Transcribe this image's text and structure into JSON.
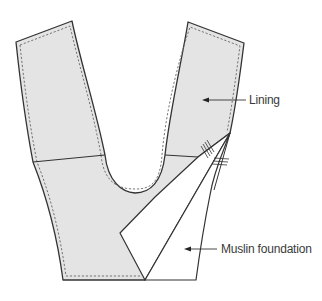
{
  "diagram": {
    "type": "garment pattern illustration",
    "colors": {
      "lining_fill": "#e4e4e4",
      "muslin_fill": "#ffffff",
      "outline": "#333333",
      "stitch": "#666666",
      "text": "#3a3a3a",
      "background": "#ffffff"
    },
    "labels": {
      "lining": "Lining",
      "muslin": "Muslin foundation"
    }
  }
}
